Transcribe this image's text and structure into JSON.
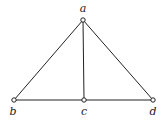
{
  "graph": {
    "nodes": [
      {
        "id": "a",
        "label": "a",
        "x": 83,
        "y": 20,
        "lx": 83,
        "ly": 12
      },
      {
        "id": "b",
        "label": "b",
        "x": 14,
        "y": 100,
        "lx": 13,
        "ly": 114
      },
      {
        "id": "c",
        "label": "c",
        "x": 84,
        "y": 100,
        "lx": 84,
        "ly": 114
      },
      {
        "id": "d",
        "label": "d",
        "x": 153,
        "y": 100,
        "lx": 153,
        "ly": 114
      }
    ],
    "edges": [
      [
        "a",
        "b"
      ],
      [
        "a",
        "c"
      ],
      [
        "a",
        "d"
      ],
      [
        "b",
        "c"
      ],
      [
        "c",
        "d"
      ]
    ]
  }
}
